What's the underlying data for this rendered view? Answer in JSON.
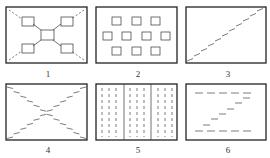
{
  "diagram": {
    "title": "",
    "panels": [
      {
        "id": 1,
        "label": "1",
        "pattern": "central-hub-with-four-corner-boxes"
      },
      {
        "id": 2,
        "label": "2",
        "pattern": "grid-of-small-squares-3-4-3"
      },
      {
        "id": 3,
        "label": "3",
        "pattern": "single-diagonal-dashed-line"
      },
      {
        "id": 4,
        "label": "4",
        "pattern": "x-shaped-dashed-lines"
      },
      {
        "id": 5,
        "label": "5",
        "pattern": "vertical-dashed-columns-in-three-sections"
      },
      {
        "id": 6,
        "label": "6",
        "pattern": "two-horizontal-dashed-rows-with-stepped-diagonal"
      }
    ]
  }
}
